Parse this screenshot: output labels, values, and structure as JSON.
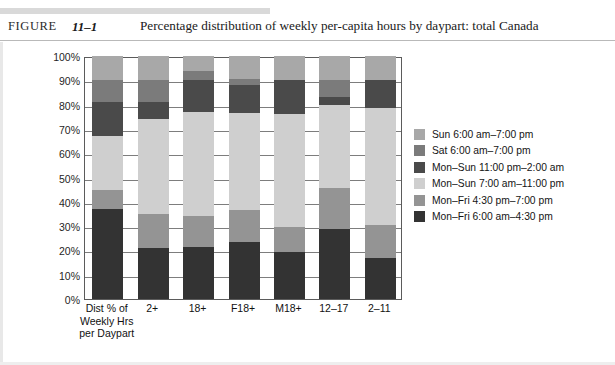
{
  "header": {
    "figure_word": "FIGURE",
    "figure_number": "11–1",
    "caption": "Percentage distribution of weekly per-capita hours by daypart: total Canada"
  },
  "legend": {
    "items": [
      {
        "label": "Sun 6:00 am–7:00 pm",
        "color": "#a8a8a8"
      },
      {
        "label": "Sat 6:00 am–7:00 pm",
        "color": "#7b7b7b"
      },
      {
        "label": "Mon–Sun 11:00 pm–2:00 am",
        "color": "#4a4a4a"
      },
      {
        "label": "Mon–Sun 7:00 am–11:00 pm",
        "color": "#cfcfcf"
      },
      {
        "label": "Mon–Fri 4:30 pm–7:00 pm",
        "color": "#949494"
      },
      {
        "label": "Mon–Fri 6:00 am–4:30 pm",
        "color": "#333333"
      }
    ]
  },
  "chart_data": {
    "type": "bar",
    "subtype": "stacked-100-percent",
    "title": "Percentage distribution of weekly per-capita hours by daypart: total Canada",
    "xlabel": "",
    "ylabel": "",
    "ylim": [
      0,
      100
    ],
    "ytick_labels": [
      "100%",
      "90%",
      "80%",
      "70%",
      "60%",
      "50%",
      "40%",
      "30%",
      "20%",
      "10%",
      "0%"
    ],
    "ytick_values": [
      100,
      90,
      80,
      70,
      60,
      50,
      40,
      30,
      20,
      10,
      0
    ],
    "grid": true,
    "legend_position": "right",
    "categories": [
      "Dist % of\nWeekly Hrs\nper Daypart",
      "2+",
      "18+",
      "F18+",
      "M18+",
      "12–17",
      "2–11"
    ],
    "category_lines": [
      [
        "Dist % of",
        "Weekly Hrs",
        "per Daypart"
      ],
      [
        "2+"
      ],
      [
        "18+"
      ],
      [
        "F18+"
      ],
      [
        "M18+"
      ],
      [
        "12–17"
      ],
      [
        "2–11"
      ]
    ],
    "series": [
      {
        "name": "Mon–Fri 6:00 am–4:30 pm",
        "color": "#333333",
        "values": [
          37.0,
          21.0,
          21.5,
          23.5,
          19.5,
          29.0,
          17.0
        ]
      },
      {
        "name": "Mon–Fri 4:30 pm–7:00 pm",
        "color": "#949494",
        "values": [
          8.0,
          14.0,
          12.5,
          13.0,
          10.0,
          16.5,
          13.5
        ]
      },
      {
        "name": "Mon–Sun 7:00 am–11:00 pm",
        "color": "#cfcfcf",
        "values": [
          22.0,
          39.0,
          43.0,
          40.0,
          46.5,
          34.5,
          48.0
        ]
      },
      {
        "name": "Mon–Sun 11:00 pm–2:00 am",
        "color": "#4a4a4a",
        "values": [
          14.0,
          7.0,
          13.0,
          11.5,
          14.0,
          3.0,
          11.5
        ]
      },
      {
        "name": "Sat 6:00 am–7:00 pm",
        "color": "#7b7b7b",
        "values": [
          9.0,
          9.0,
          4.0,
          2.5,
          0.0,
          7.0,
          0.0
        ]
      },
      {
        "name": "Sun 6:00 am–7:00 pm",
        "color": "#a8a8a8",
        "values": [
          10.0,
          10.0,
          6.0,
          9.5,
          10.0,
          10.0,
          10.0
        ]
      }
    ],
    "cumulative_tops": [
      [
        37.0,
        45.0,
        67.0,
        81.0,
        90.0,
        100.0
      ],
      [
        21.0,
        35.0,
        74.0,
        81.0,
        90.0,
        100.0
      ],
      [
        21.5,
        34.0,
        77.0,
        90.0,
        94.0,
        100.0
      ],
      [
        23.5,
        36.5,
        76.5,
        88.0,
        90.5,
        100.0
      ],
      [
        19.5,
        29.5,
        76.0,
        90.0,
        90.0,
        100.0
      ],
      [
        29.0,
        45.5,
        80.0,
        83.0,
        90.0,
        100.0
      ],
      [
        17.0,
        30.5,
        78.5,
        90.0,
        90.0,
        100.0
      ]
    ]
  }
}
